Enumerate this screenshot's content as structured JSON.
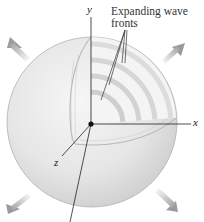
{
  "figure": {
    "annotation": {
      "line1": "Expanding wave",
      "line2": "fronts"
    },
    "axes": {
      "x": "x",
      "y": "y",
      "z": "z"
    },
    "colors": {
      "sphere_light": "#f2f2f2",
      "sphere_dark": "#cfcfcf",
      "outline": "#a8a8a8",
      "axis": "#222222",
      "arrow": "#b5b5b5"
    },
    "wavefront_count": 4,
    "arrow_directions": [
      "upper-left",
      "upper-right",
      "lower-left",
      "lower-right"
    ]
  }
}
